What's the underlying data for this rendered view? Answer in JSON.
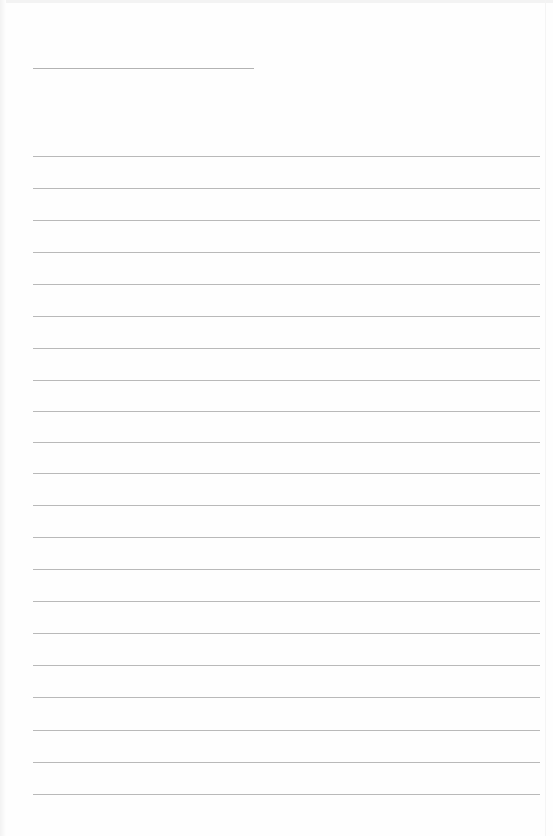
{
  "document": {
    "type": "lined-paper",
    "background_color": "#fefefe",
    "line_color": "#b9b9b9",
    "header_line": {
      "x": 33,
      "y": 68,
      "width": 221
    },
    "ruled_lines": {
      "x": 33,
      "width": 507,
      "y_positions": [
        156,
        188,
        220,
        252,
        284,
        316,
        348,
        380,
        411,
        442,
        473,
        505,
        537,
        569,
        601,
        633,
        665,
        697,
        730,
        762,
        794
      ]
    },
    "text": []
  }
}
